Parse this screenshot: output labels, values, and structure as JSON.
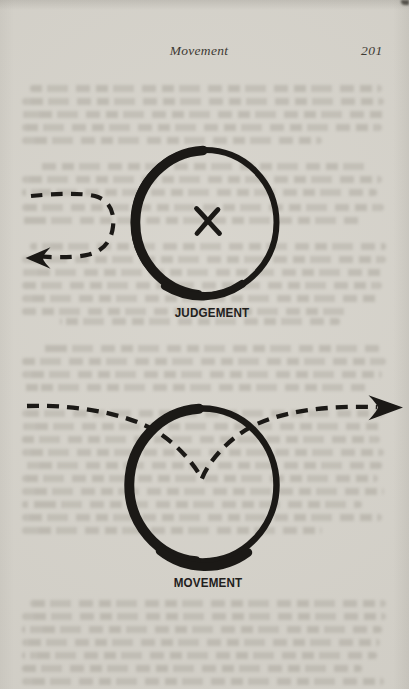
{
  "header": {
    "running_title": "Movement",
    "page_number": "201"
  },
  "diagrams": {
    "judgement": {
      "label": "JUDGEMENT",
      "description": "Dashed arrow approaches a large hand-drawn circle, makes a U-turn outside it and exits back to the left; an X marks the centre of the circle"
    },
    "movement": {
      "label": "MOVEMENT",
      "description": "Dashed arrow enters a large hand-drawn circle from the left, dips in a V toward the centre and continues out the upper right, ending in a solid arrowhead"
    }
  },
  "colors": {
    "paper": "#d6d3cb",
    "ink": "#1b1916",
    "header_text": "#3e3a34",
    "ghost_text": "#8a857a"
  }
}
